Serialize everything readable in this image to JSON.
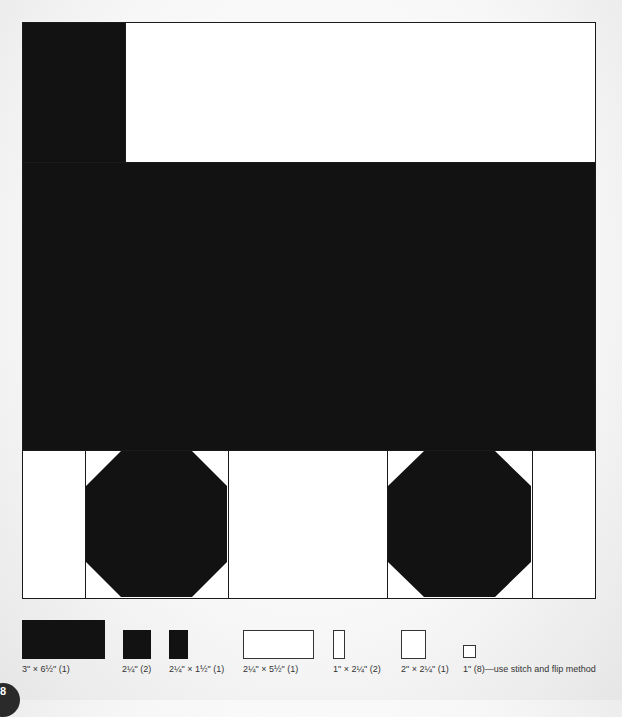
{
  "diagram": {
    "colors": {
      "dark": "#121212",
      "light": "#ffffff",
      "outline": "#1a1a1a"
    }
  },
  "legend": {
    "pieces": [
      {
        "label": "3\" × 6½\" (1)",
        "fill": "dark"
      },
      {
        "label": "2¼\" (2)",
        "fill": "dark"
      },
      {
        "label": "2¼\" × 1½\" (1)",
        "fill": "dark"
      },
      {
        "label": "2¼\" × 5½\" (1)",
        "fill": "light"
      },
      {
        "label": "1\" × 2¼\" (2)",
        "fill": "light"
      },
      {
        "label": "2\" × 2¼\" (1)",
        "fill": "light"
      },
      {
        "label": "1\" (8)—use stitch and flip method",
        "fill": "light"
      }
    ]
  },
  "page": {
    "number": "8"
  }
}
